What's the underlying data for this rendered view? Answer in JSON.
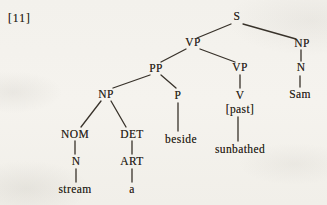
{
  "example_number": "[11]",
  "tree": {
    "nodes": {
      "s": "S",
      "vp_main": "VP",
      "np_subject": "NP",
      "pp": "PP",
      "vp_inner": "VP",
      "n_subject": "N",
      "np_object": "NP",
      "p": "P",
      "v": "V",
      "sam": "Sam",
      "tense": "[past]",
      "nom": "NOM",
      "det": "DET",
      "beside": "beside",
      "n_object": "N",
      "art": "ART",
      "sunbathed": "sunbathed",
      "stream": "stream",
      "a": "a"
    },
    "edges": [
      [
        "s",
        "vp_main"
      ],
      [
        "s",
        "np_subject"
      ],
      [
        "vp_main",
        "pp"
      ],
      [
        "vp_main",
        "vp_inner"
      ],
      [
        "np_subject",
        "n_subject"
      ],
      [
        "n_subject",
        "sam"
      ],
      [
        "pp",
        "np_object"
      ],
      [
        "pp",
        "p"
      ],
      [
        "vp_inner",
        "v"
      ],
      [
        "v",
        "tense"
      ],
      [
        "tense",
        "sunbathed"
      ],
      [
        "p",
        "beside"
      ],
      [
        "np_object",
        "nom"
      ],
      [
        "np_object",
        "det"
      ],
      [
        "nom",
        "n_object"
      ],
      [
        "n_object",
        "stream"
      ],
      [
        "det",
        "art"
      ],
      [
        "art",
        "a"
      ]
    ]
  }
}
